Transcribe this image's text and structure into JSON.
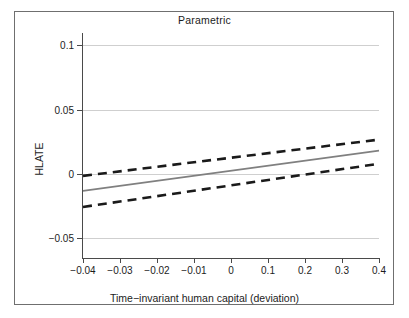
{
  "figure": {
    "title": "Parametric",
    "xlabel": "Time−invariant human capital (deviation)",
    "ylabel": "HLATE",
    "frame_color": "#6f6f6f",
    "grid_color": "#cfcfcf",
    "fit_color": "#808080",
    "ci_color": "#1a1a1a"
  },
  "chart_data": {
    "type": "line",
    "title": "Parametric",
    "xlabel": "Time−invariant human capital (deviation)",
    "ylabel": "HLATE",
    "grid": true,
    "legend": "none",
    "xlim": [
      -0.04,
      0.4
    ],
    "ylim": [
      -0.0655,
      0.1095
    ],
    "xticks": [
      -0.04,
      -0.03,
      -0.02,
      -0.01,
      0,
      0.1,
      0.2,
      0.3,
      0.4
    ],
    "xtick_labels": [
      "-0.04",
      "-0.03",
      "-0.02",
      "-0.01",
      "0",
      "0.1",
      "0.2",
      "0.3",
      "0.4"
    ],
    "yticks": [
      0.1,
      0.05,
      0,
      -0.05
    ],
    "ytick_labels": [
      "0.1",
      "0.05",
      "0",
      "-0.05"
    ],
    "x": [
      -0.04,
      0.4
    ],
    "series": [
      {
        "name": "HLATE fit",
        "style": "solid",
        "color": "#808080",
        "values": [
          -0.0133,
          0.018
        ]
      },
      {
        "name": "Upper 95% confidence band",
        "style": "dashed",
        "color": "#1a1a1a",
        "values": [
          -0.0016,
          0.0266
        ]
      },
      {
        "name": "Lower 95% confidence band",
        "style": "dashed",
        "color": "#1a1a1a",
        "values": [
          -0.0258,
          0.0078
        ]
      }
    ]
  }
}
